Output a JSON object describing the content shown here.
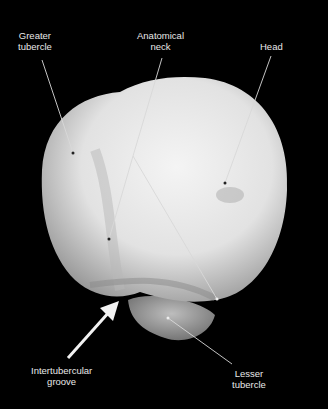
{
  "figure": {
    "labels": [
      {
        "id": "greater-tubercle",
        "text": "Greater\ntubercle"
      },
      {
        "id": "anatomical-neck",
        "text": "Anatomical\nneck"
      },
      {
        "id": "head",
        "text": "Head"
      },
      {
        "id": "intertubercular-groove",
        "text": "Intertubercular\ngroove"
      },
      {
        "id": "lesser-tubercle",
        "text": "Lesser\ntubercle"
      }
    ],
    "colors": {
      "background": "#000000",
      "bone": "#e6e6e6",
      "text": "#e8e8e8",
      "leader": "#d0d0d0"
    }
  }
}
